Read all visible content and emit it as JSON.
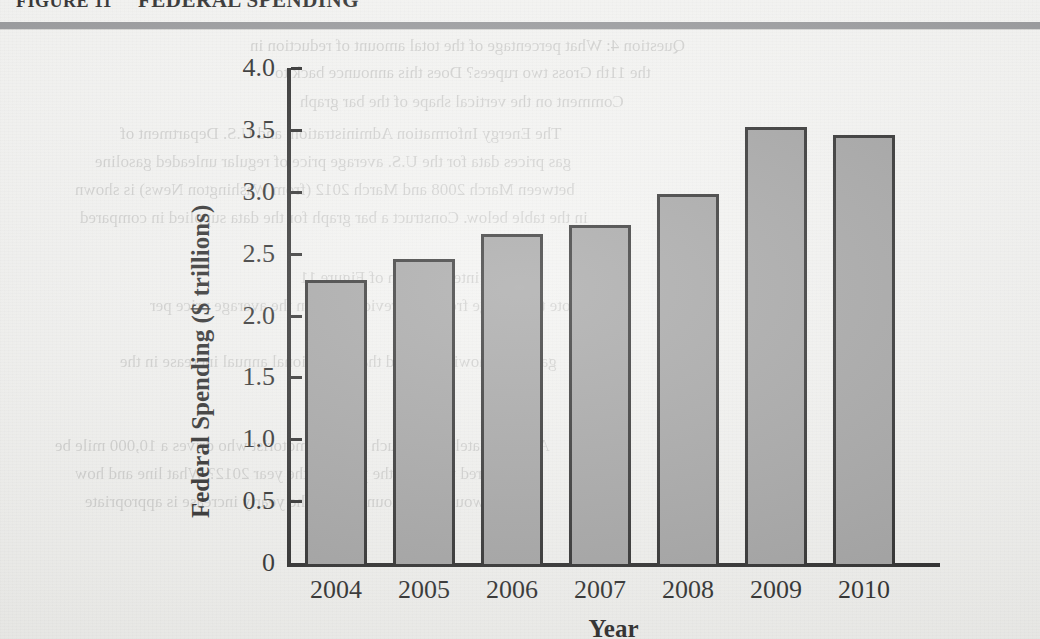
{
  "figure": {
    "number": "FIGURE 11",
    "title": "FEDERAL SPENDING"
  },
  "chart_data": {
    "type": "bar",
    "title": "FEDERAL SPENDING",
    "xlabel": "Year",
    "ylabel": "Federal Spending ($ trillions)",
    "categories": [
      "2004",
      "2005",
      "2006",
      "2007",
      "2008",
      "2009",
      "2010"
    ],
    "values": [
      2.29,
      2.46,
      2.66,
      2.73,
      2.98,
      3.52,
      3.46
    ],
    "ylim": [
      0,
      4.0
    ],
    "ytick_labels": [
      "0",
      "0.5",
      "1.0",
      "1.5",
      "2.0",
      "2.5",
      "3.0",
      "3.5",
      "4.0"
    ],
    "ytick_values": [
      0,
      0.5,
      1.0,
      1.5,
      2.0,
      2.5,
      3.0,
      3.5,
      4.0
    ],
    "grid": false,
    "legend": "none",
    "bar_fill_color": "#969696",
    "bar_edge_color": "#131313"
  },
  "background_text": [
    {
      "text": "Question 4:  What percentage of the total amount of reduction in",
      "x": 250,
      "y": 36,
      "size": 17
    },
    {
      "text": "the 11th Gross two rupees? Does this announce back to",
      "x": 275,
      "y": 63,
      "size": 17
    },
    {
      "text": "Comment on the vertical shape of the bar graph",
      "x": 300,
      "y": 92,
      "size": 17
    },
    {
      "text": "The Energy Information Administration, and U.S. Department of",
      "x": 120,
      "y": 124,
      "size": 17
    },
    {
      "text": "gas prices data for the U.S. average price of regular unleaded gasoline",
      "x": 95,
      "y": 152,
      "size": 17
    },
    {
      "text": "between March 2008 and March 2012 (from Washington News) is shown",
      "x": 75,
      "y": 180,
      "size": 17
    },
    {
      "text": "in the table below. Construct a bar graph for the data supplied in compared",
      "x": 80,
      "y": 208,
      "size": 17
    },
    {
      "text": "interpretation of Figure 11",
      "x": 300,
      "y": 268,
      "size": 17
    },
    {
      "text": "Note the change from the previous year in the average price per",
      "x": 150,
      "y": 296,
      "size": 17
    },
    {
      "text": "gallon is showing a trend that the national annual increase in the",
      "x": 120,
      "y": 352,
      "size": 17
    },
    {
      "text": "Approximately how much would a motorist who drives a 10,000 mile be",
      "x": 55,
      "y": 436,
      "size": 17
    },
    {
      "text": "prepared to pay at the pump in the year 2012? What line and how",
      "x": 75,
      "y": 464,
      "size": 17
    },
    {
      "text": "would the amount paid if the yearly increase is appropriate",
      "x": 85,
      "y": 492,
      "size": 17
    }
  ],
  "layout": {
    "plot_left": 287,
    "plot_right": 940,
    "plot_top": 68,
    "plot_bottom": 563,
    "bar_width": 62,
    "bar_slot": 88
  }
}
